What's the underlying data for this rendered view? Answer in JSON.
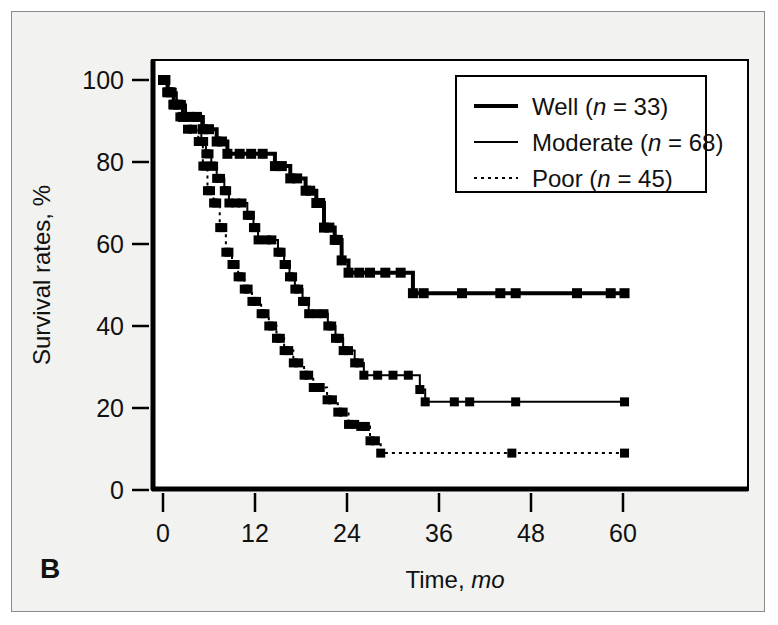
{
  "figure": {
    "panel_label": "B",
    "background_color": "#f2f2f0",
    "plot_background_color": "#ffffff",
    "border_color": "#8b8b8b",
    "ink_color": "#000000"
  },
  "chart_data": {
    "type": "line",
    "subtype": "kaplan-meier-step",
    "title": "",
    "xlabel": "Time, mo",
    "xlabel_plain": "Time,",
    "xlabel_italic": "mo",
    "ylabel": "Survival rates, %",
    "xlim": [
      0,
      62
    ],
    "ylim": [
      0,
      105
    ],
    "xticks": [
      0,
      12,
      24,
      36,
      48,
      60
    ],
    "xtick_labels": [
      "0",
      "12",
      "24",
      "36",
      "48",
      "60"
    ],
    "yticks": [
      0,
      20,
      40,
      60,
      80,
      100
    ],
    "ytick_labels": [
      "0",
      "20",
      "40",
      "60",
      "80",
      "100"
    ],
    "grid": false,
    "legend_position": "top-right",
    "series": [
      {
        "name": "Well",
        "label": "Well (n = 33)",
        "label_plain_pre": "Well (",
        "label_italic": "n",
        "label_plain_post": " = 33)",
        "n": 33,
        "style": "solid-thick",
        "line_width": 4,
        "dash": "none",
        "color": "#000000",
        "points": [
          [
            0,
            100
          ],
          [
            0.6,
            100
          ],
          [
            0.6,
            97
          ],
          [
            1.4,
            97
          ],
          [
            1.4,
            94
          ],
          [
            2.6,
            94
          ],
          [
            2.6,
            91
          ],
          [
            5.2,
            91
          ],
          [
            5.2,
            88
          ],
          [
            7.0,
            88
          ],
          [
            7.0,
            85
          ],
          [
            8.4,
            85
          ],
          [
            8.4,
            82
          ],
          [
            14.6,
            82
          ],
          [
            14.6,
            79
          ],
          [
            16.6,
            79
          ],
          [
            16.6,
            76
          ],
          [
            18.6,
            76
          ],
          [
            18.6,
            73
          ],
          [
            20.0,
            73
          ],
          [
            20.0,
            70
          ],
          [
            21.0,
            70
          ],
          [
            21.0,
            64
          ],
          [
            22.4,
            64
          ],
          [
            22.4,
            61
          ],
          [
            23.3,
            61
          ],
          [
            23.3,
            56
          ],
          [
            24.2,
            56
          ],
          [
            24.2,
            53
          ],
          [
            32.6,
            53
          ],
          [
            32.6,
            48
          ],
          [
            60.2,
            48
          ]
        ],
        "censor_marks": [
          [
            0.3,
            100
          ],
          [
            1.0,
            97
          ],
          [
            2.0,
            94
          ],
          [
            3.5,
            91
          ],
          [
            4.4,
            91
          ],
          [
            6.0,
            88
          ],
          [
            7.7,
            85
          ],
          [
            10.0,
            82
          ],
          [
            11.5,
            82
          ],
          [
            13.0,
            82
          ],
          [
            15.5,
            79
          ],
          [
            17.5,
            76
          ],
          [
            19.2,
            73
          ],
          [
            20.5,
            70
          ],
          [
            21.7,
            64
          ],
          [
            22.8,
            61
          ],
          [
            25.6,
            53
          ],
          [
            27.0,
            53
          ],
          [
            29.0,
            53
          ],
          [
            31.0,
            53
          ],
          [
            34.0,
            48
          ],
          [
            39.0,
            48
          ],
          [
            44.0,
            48
          ],
          [
            46.0,
            48
          ],
          [
            54.0,
            48
          ],
          [
            58.4,
            48
          ],
          [
            60.2,
            48
          ]
        ]
      },
      {
        "name": "Moderate",
        "label": "Moderate (n = 68)",
        "label_plain_pre": "Moderate (",
        "label_italic": "n",
        "label_plain_post": " = 68)",
        "n": 68,
        "style": "solid-thin",
        "line_width": 2,
        "dash": "none",
        "color": "#000000",
        "points": [
          [
            0,
            100
          ],
          [
            0.7,
            100
          ],
          [
            0.7,
            97
          ],
          [
            1.8,
            97
          ],
          [
            1.8,
            94
          ],
          [
            3.0,
            94
          ],
          [
            3.0,
            91
          ],
          [
            5.0,
            91
          ],
          [
            5.0,
            85
          ],
          [
            5.6,
            85
          ],
          [
            5.6,
            82
          ],
          [
            6.3,
            82
          ],
          [
            6.3,
            79
          ],
          [
            7.0,
            79
          ],
          [
            7.0,
            76
          ],
          [
            8.0,
            76
          ],
          [
            8.0,
            73
          ],
          [
            8.6,
            73
          ],
          [
            8.6,
            70
          ],
          [
            11.0,
            70
          ],
          [
            11.0,
            67
          ],
          [
            11.8,
            67
          ],
          [
            11.8,
            64
          ],
          [
            12.4,
            64
          ],
          [
            12.4,
            61
          ],
          [
            15.0,
            61
          ],
          [
            15.0,
            58
          ],
          [
            15.8,
            58
          ],
          [
            15.8,
            55
          ],
          [
            16.5,
            55
          ],
          [
            16.5,
            52
          ],
          [
            17.2,
            52
          ],
          [
            17.2,
            49
          ],
          [
            18.2,
            49
          ],
          [
            18.2,
            46
          ],
          [
            19.0,
            46
          ],
          [
            19.0,
            43
          ],
          [
            21.5,
            43
          ],
          [
            21.5,
            40
          ],
          [
            22.5,
            40
          ],
          [
            22.5,
            37
          ],
          [
            23.5,
            37
          ],
          [
            23.5,
            34
          ],
          [
            25.0,
            34
          ],
          [
            25.0,
            31
          ],
          [
            26.2,
            31
          ],
          [
            26.2,
            28
          ],
          [
            33.5,
            28
          ],
          [
            33.5,
            24.5
          ],
          [
            34.2,
            24.5
          ],
          [
            34.2,
            21.5
          ],
          [
            60.2,
            21.5
          ]
        ],
        "censor_marks": [
          [
            0.35,
            100
          ],
          [
            1.2,
            97
          ],
          [
            2.4,
            94
          ],
          [
            4.0,
            91
          ],
          [
            4.5,
            91
          ],
          [
            5.3,
            85
          ],
          [
            6.0,
            82
          ],
          [
            6.6,
            79
          ],
          [
            7.5,
            76
          ],
          [
            8.3,
            73
          ],
          [
            9.5,
            70
          ],
          [
            10.3,
            70
          ],
          [
            11.4,
            67
          ],
          [
            12.1,
            64
          ],
          [
            13.5,
            61
          ],
          [
            14.2,
            61
          ],
          [
            15.4,
            58
          ],
          [
            16.1,
            55
          ],
          [
            16.9,
            52
          ],
          [
            17.7,
            49
          ],
          [
            18.6,
            46
          ],
          [
            20.0,
            43
          ],
          [
            21.0,
            43
          ],
          [
            22.0,
            40
          ],
          [
            23.0,
            37
          ],
          [
            24.2,
            34
          ],
          [
            25.6,
            31
          ],
          [
            28.0,
            28
          ],
          [
            30.0,
            28
          ],
          [
            32.0,
            28
          ],
          [
            38.0,
            21.5
          ],
          [
            40.0,
            21.5
          ],
          [
            46.0,
            21.5
          ],
          [
            60.2,
            21.5
          ]
        ]
      },
      {
        "name": "Poor",
        "label": "Poor (n = 45)",
        "label_plain_pre": "Poor (",
        "label_italic": "n",
        "label_plain_post": " = 45)",
        "n": 45,
        "style": "dotted",
        "line_width": 2,
        "dash": "3,4",
        "color": "#000000",
        "points": [
          [
            0,
            100
          ],
          [
            0.5,
            100
          ],
          [
            0.5,
            97
          ],
          [
            1.3,
            97
          ],
          [
            1.3,
            94
          ],
          [
            2.2,
            94
          ],
          [
            2.2,
            91
          ],
          [
            3.2,
            91
          ],
          [
            3.2,
            88
          ],
          [
            4.6,
            88
          ],
          [
            4.6,
            85
          ],
          [
            5.2,
            85
          ],
          [
            5.2,
            79
          ],
          [
            5.8,
            79
          ],
          [
            5.8,
            73
          ],
          [
            6.6,
            73
          ],
          [
            6.6,
            70
          ],
          [
            7.4,
            70
          ],
          [
            7.4,
            64
          ],
          [
            8.2,
            64
          ],
          [
            8.2,
            58
          ],
          [
            9.0,
            58
          ],
          [
            9.0,
            55
          ],
          [
            9.8,
            55
          ],
          [
            9.8,
            52
          ],
          [
            10.6,
            52
          ],
          [
            10.6,
            49
          ],
          [
            11.6,
            49
          ],
          [
            11.6,
            46
          ],
          [
            12.8,
            46
          ],
          [
            12.8,
            43
          ],
          [
            13.8,
            43
          ],
          [
            13.8,
            40
          ],
          [
            14.8,
            40
          ],
          [
            14.8,
            37
          ],
          [
            15.8,
            37
          ],
          [
            15.8,
            34
          ],
          [
            17.0,
            34
          ],
          [
            17.0,
            31
          ],
          [
            18.4,
            31
          ],
          [
            18.4,
            28
          ],
          [
            19.6,
            28
          ],
          [
            19.6,
            25
          ],
          [
            21.4,
            25
          ],
          [
            21.4,
            22
          ],
          [
            22.8,
            22
          ],
          [
            22.8,
            19
          ],
          [
            24.2,
            19
          ],
          [
            24.2,
            16
          ],
          [
            25.8,
            16
          ],
          [
            25.8,
            15.5
          ],
          [
            27.0,
            15.5
          ],
          [
            27.0,
            12
          ],
          [
            28.4,
            12
          ],
          [
            28.4,
            9
          ],
          [
            60.2,
            9
          ]
        ],
        "censor_marks": [
          [
            0.25,
            100
          ],
          [
            0.9,
            97
          ],
          [
            1.7,
            94
          ],
          [
            2.7,
            91
          ],
          [
            3.9,
            88
          ],
          [
            4.9,
            85
          ],
          [
            5.5,
            79
          ],
          [
            6.2,
            73
          ],
          [
            7.0,
            70
          ],
          [
            7.8,
            64
          ],
          [
            8.6,
            58
          ],
          [
            9.4,
            55
          ],
          [
            10.2,
            52
          ],
          [
            11.1,
            49
          ],
          [
            12.2,
            46
          ],
          [
            13.3,
            43
          ],
          [
            14.3,
            40
          ],
          [
            15.3,
            37
          ],
          [
            16.4,
            34
          ],
          [
            17.7,
            31
          ],
          [
            19.0,
            28
          ],
          [
            20.5,
            25
          ],
          [
            22.1,
            22
          ],
          [
            23.5,
            19
          ],
          [
            25.0,
            16
          ],
          [
            26.4,
            15.5
          ],
          [
            27.7,
            12
          ],
          [
            45.5,
            9
          ],
          [
            60.2,
            9
          ]
        ]
      }
    ]
  }
}
